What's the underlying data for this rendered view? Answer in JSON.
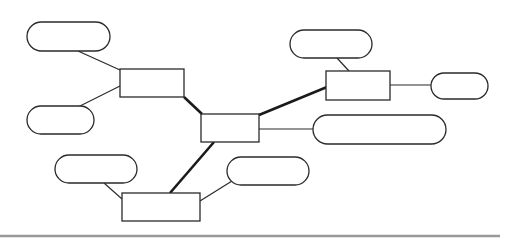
{
  "diagram": {
    "type": "network",
    "nodes": [
      {
        "id": "box-center",
        "shape": "rect",
        "label": "",
        "x": 201,
        "y": 114,
        "w": 58,
        "h": 28
      },
      {
        "id": "box-left",
        "shape": "rect",
        "label": "",
        "x": 120,
        "y": 69,
        "w": 64,
        "h": 28
      },
      {
        "id": "box-right",
        "shape": "rect",
        "label": "",
        "x": 326,
        "y": 71,
        "w": 64,
        "h": 29
      },
      {
        "id": "box-bottom",
        "shape": "rect",
        "label": "",
        "x": 122,
        "y": 193,
        "w": 78,
        "h": 28
      },
      {
        "id": "pill-top-left",
        "shape": "pill",
        "label": "",
        "x": 27,
        "y": 22,
        "w": 83,
        "h": 29
      },
      {
        "id": "pill-mid-left",
        "shape": "pill",
        "label": "",
        "x": 27,
        "y": 106,
        "w": 67,
        "h": 28
      },
      {
        "id": "pill-low-left",
        "shape": "pill",
        "label": "",
        "x": 55,
        "y": 155,
        "w": 82,
        "h": 28
      },
      {
        "id": "pill-low-right",
        "shape": "pill",
        "label": "",
        "x": 227,
        "y": 157,
        "w": 82,
        "h": 28
      },
      {
        "id": "pill-top-right",
        "shape": "pill",
        "label": "",
        "x": 290,
        "y": 30,
        "w": 82,
        "h": 28
      },
      {
        "id": "pill-far-right",
        "shape": "pill",
        "label": "",
        "x": 431,
        "y": 73,
        "w": 57,
        "h": 26
      },
      {
        "id": "pill-wide-right",
        "shape": "pill",
        "label": "",
        "x": 313,
        "y": 115,
        "w": 133,
        "h": 29
      }
    ],
    "edges": [
      {
        "from": "pill-top-left",
        "to": "box-left",
        "weight": "thin",
        "x1": 78,
        "y1": 51,
        "x2": 120,
        "y2": 70
      },
      {
        "from": "pill-mid-left",
        "to": "box-left",
        "weight": "thin",
        "x1": 78,
        "y1": 107,
        "x2": 120,
        "y2": 86
      },
      {
        "from": "box-left",
        "to": "box-center",
        "weight": "thick",
        "x1": 184,
        "y1": 97,
        "x2": 202,
        "y2": 114
      },
      {
        "from": "box-center",
        "to": "box-right",
        "weight": "thick",
        "x1": 259,
        "y1": 115,
        "x2": 327,
        "y2": 87
      },
      {
        "from": "pill-top-right",
        "to": "box-right",
        "weight": "thin",
        "x1": 337,
        "y1": 58,
        "x2": 349,
        "y2": 71
      },
      {
        "from": "box-right",
        "to": "pill-far-right",
        "weight": "thin",
        "x1": 390,
        "y1": 85,
        "x2": 431,
        "y2": 85
      },
      {
        "from": "box-center",
        "to": "pill-wide-right",
        "weight": "thin",
        "x1": 259,
        "y1": 129,
        "x2": 313,
        "y2": 129
      },
      {
        "from": "box-center",
        "to": "box-bottom",
        "weight": "thick",
        "x1": 214,
        "y1": 142,
        "x2": 170,
        "y2": 193
      },
      {
        "from": "pill-low-left",
        "to": "box-bottom",
        "weight": "thin",
        "x1": 104,
        "y1": 183,
        "x2": 122,
        "y2": 199
      },
      {
        "from": "pill-low-right",
        "to": "box-bottom",
        "weight": "thin",
        "x1": 232,
        "y1": 181,
        "x2": 200,
        "y2": 201
      }
    ]
  },
  "footer": {
    "rule": {
      "x1": 0,
      "x2": 500,
      "y": 236,
      "color": "#9a9a9a"
    }
  }
}
